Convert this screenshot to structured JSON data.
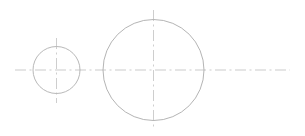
{
  "document": {
    "title": "Technical Drawing — Two Circles with Centerlines",
    "type": "engineering-line-drawing",
    "width": 305,
    "height": 136,
    "background_color": "#ffffff"
  },
  "styles": {
    "outline_color": "#b0b0b0",
    "centerline_color": "#bcbcbc",
    "outline_width": 0.9,
    "centerline_width": 0.8,
    "centerline_dash": "9 3 2 3",
    "faint_centerline_color": "#cfcfcf"
  },
  "shapes": [
    {
      "name": "small-circle",
      "label": "Small Circle",
      "cx": 56.5,
      "cy": 70,
      "r": 23.5,
      "stroke": "#b0b0b0",
      "stroke_width": 0.9
    },
    {
      "name": "large-circle",
      "label": "Large Circle",
      "cx": 153.5,
      "cy": 70,
      "r": 50.5,
      "stroke": "#ababab",
      "stroke_width": 0.9
    }
  ],
  "centerlines": [
    {
      "name": "horizontal-axis-centerline",
      "label": "Horizontal Axis Centerline",
      "orientation": "horizontal",
      "x1": 15,
      "y1": 70,
      "x2": 290,
      "y2": 70,
      "stroke": "#bebebe",
      "stroke_width": 0.8,
      "dash": "11 3.5 2 3.5"
    },
    {
      "name": "small-circle-vertical-centerline",
      "label": "Small Circle Vertical Centerline",
      "orientation": "vertical",
      "x1": 56.5,
      "y1": 38,
      "x2": 56.5,
      "y2": 103,
      "stroke": "#c2c2c2",
      "stroke_width": 0.8,
      "dash": "11 3.5 2 3.5"
    },
    {
      "name": "large-circle-vertical-centerline",
      "label": "Large Circle Vertical Centerline",
      "orientation": "vertical",
      "x1": 153.5,
      "y1": 10,
      "x2": 153.5,
      "y2": 130,
      "stroke": "#c2c2c2",
      "stroke_width": 0.8,
      "dash": "11 3.5 2 3.5"
    }
  ]
}
